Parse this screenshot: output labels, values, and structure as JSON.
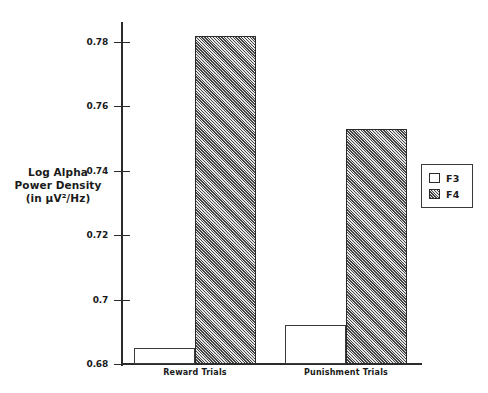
{
  "chart_data": {
    "type": "bar",
    "title": "",
    "subtitle": "",
    "xlabel": "",
    "ylabel": "Log Alpha Power Density (in µV²/Hz)",
    "ylabel_lines": [
      "Log Alpha",
      "Power Density",
      "(in µV²/Hz)"
    ],
    "categories": [
      "Reward Trials",
      "Punishment Trials"
    ],
    "series": [
      {
        "name": "F3",
        "values": [
          0.685,
          0.692
        ],
        "fill": "white",
        "swatch": "hollow-square"
      },
      {
        "name": "F4",
        "values": [
          0.782,
          0.753
        ],
        "fill": "hatched",
        "swatch": "hatched-square"
      }
    ],
    "ylim": [
      0.68,
      0.79
    ],
    "yticks": [
      0.68,
      0.7,
      0.72,
      0.74,
      0.76,
      0.78
    ],
    "ytick_labels": [
      "0.68",
      "0.7",
      "0.72",
      "0.74",
      "0.76",
      "0.78"
    ],
    "grid": false,
    "legend_position": "right",
    "legend_entries": [
      "F3",
      "F4"
    ],
    "colors": {
      "axis": "#2b2b2b",
      "bar_f3": "#ffffff",
      "bar_f4": "#9a9a9a",
      "bar_outline": "#3a3a3a",
      "text": "#1a1a1a",
      "background": "#ffffff"
    }
  }
}
